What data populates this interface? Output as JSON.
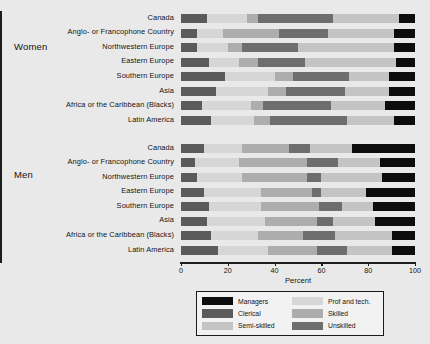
{
  "chart_data": {
    "type": "bar",
    "orientation": "horizontal",
    "stacked": true,
    "title": "",
    "xlabel": "Percent",
    "ylabel": "",
    "xlim": [
      0,
      100
    ],
    "xticks": [
      0,
      20,
      40,
      60,
      80,
      100
    ],
    "grid": false,
    "legend_position": "bottom",
    "series": [
      {
        "name": "Clerical",
        "color": "#5b5b5b"
      },
      {
        "name": "Prof and tech.",
        "color": "#d6d6d6"
      },
      {
        "name": "Skilled",
        "color": "#adadad"
      },
      {
        "name": "Unskilled",
        "color": "#6e6e6e"
      },
      {
        "name": "Semi-skilled",
        "color": "#c4c4c4"
      },
      {
        "name": "Managers",
        "color": "#0d0d0d"
      }
    ],
    "groups": [
      {
        "label": "Women",
        "categories": [
          "Canada",
          "Anglo- or Francophone Country",
          "Northwestern Europe",
          "Eastern Europe",
          "Southern Europe",
          "Asia",
          "Africa or the Caribbean (Blacks)",
          "Latin America"
        ],
        "values": [
          [
            11,
            17,
            5,
            32,
            28,
            7
          ],
          [
            7,
            11,
            24,
            21,
            28,
            9
          ],
          [
            7,
            13,
            6,
            24,
            41,
            9
          ],
          [
            12,
            13,
            8,
            20,
            39,
            8
          ],
          [
            19,
            21,
            8,
            24,
            17,
            11
          ],
          [
            15,
            22,
            8,
            25,
            19,
            11
          ],
          [
            9,
            21,
            5,
            29,
            23,
            13
          ],
          [
            13,
            18,
            7,
            33,
            20,
            9
          ]
        ]
      },
      {
        "label": "Men",
        "categories": [
          "Canada",
          "Anglo- or Francophone Country",
          "Northwestern Europe",
          "Eastern Europe",
          "Southern Europe",
          "Asia",
          "Africa or the Caribbean (Blacks)",
          "Latin America"
        ],
        "values": [
          [
            10,
            16,
            20,
            9,
            18,
            27
          ],
          [
            6,
            19,
            29,
            13,
            18,
            15
          ],
          [
            7,
            19,
            28,
            6,
            26,
            14
          ],
          [
            10,
            24,
            22,
            4,
            19,
            21
          ],
          [
            12,
            22,
            25,
            10,
            13,
            18
          ],
          [
            11,
            25,
            22,
            7,
            18,
            17
          ],
          [
            13,
            20,
            19,
            14,
            24,
            10
          ],
          [
            16,
            21,
            21,
            13,
            19,
            10
          ]
        ]
      }
    ]
  },
  "legend": {
    "items": [
      {
        "label": "Managers",
        "color": "#0d0d0d"
      },
      {
        "label": "Prof and tech.",
        "color": "#d6d6d6"
      },
      {
        "label": "Clerical",
        "color": "#5b5b5b"
      },
      {
        "label": "Skilled",
        "color": "#adadad"
      },
      {
        "label": "Semi-skilled",
        "color": "#c4c4c4"
      },
      {
        "label": "Unskilled",
        "color": "#6e6e6e"
      }
    ]
  }
}
